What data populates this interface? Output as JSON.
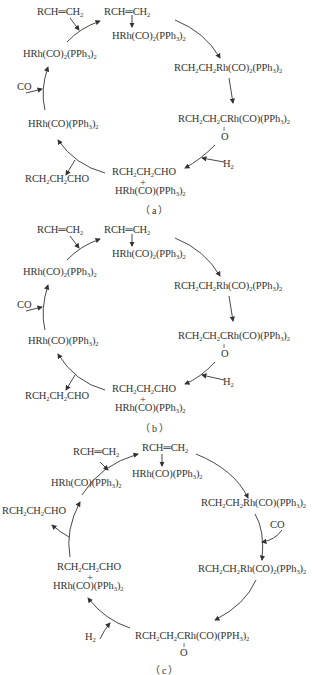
{
  "panels": [
    {
      "caption": "（a）",
      "species": {
        "alkene_in": "RCH=CH2",
        "alkene_complex_top": "RCH=CH2",
        "complex_top": "HRh(CO)2(PPh3)2",
        "alkyl_complex": "RCH2CH2Rh(CO)2(PPh3)2",
        "acyl_complex": "RCH2CH2CRh(CO)(PPh3)2",
        "acyl_oxygen": "O",
        "h2_in": "H2",
        "aldehyde_plus_complex_line1": "RCH2CH2CHO",
        "plus": "+",
        "aldehyde_plus_complex_line2": "HRh(CO)(PPh3)2",
        "aldehyde_out": "RCH2CH2CHO",
        "unsaturated_complex": "HRh(CO)(PPh3)2",
        "co_in": "CO",
        "catalyst": "HRh(CO)2(PPh3)2"
      }
    },
    {
      "caption": "（b）",
      "species": {
        "alkene_in": "RCH=CH2",
        "alkene_complex_top": "RCH=CH2",
        "complex_top": "HRh(CO)2(PPh3)2",
        "alkyl_complex": "RCH2CH2Rh(CO)2(PPh3)2",
        "acyl_complex": "RCH2CH2CRh(CO)(PPh3)2",
        "acyl_oxygen": "O",
        "h2_in": "H2",
        "aldehyde_plus_complex_line1": "RCH2CH2CHO",
        "plus": "+",
        "aldehyde_plus_complex_line2": "HRh(CO)(PPh3)2",
        "aldehyde_out": "RCH2CH2CHO",
        "unsaturated_complex": "HRh(CO)(PPh3)2",
        "co_in": "CO",
        "catalyst": "HRh(CO)2(PPh3)2"
      }
    },
    {
      "caption": "（c）",
      "species": {
        "alkene_in": "RCH=CH2",
        "alkene_complex_top": "RCH=CH2",
        "complex_top": "HRh(CO)(PPh3)2",
        "alkyl_complex": "RCH2CH2Rh(CO)(PPh3)2",
        "co_in": "CO",
        "alkyl_co_complex": "RCH2CH2Rh(CO)2(PPh3)2",
        "acyl_complex": "RCH2CH2CRh(CO)(PPH3)2",
        "acyl_oxygen": "O",
        "h2_in": "H2",
        "aldehyde_plus_complex_line1": "RCH2CH2CHO",
        "plus": "+",
        "aldehyde_plus_complex_line2": "HRh(CO)(PPh3)2",
        "aldehyde_out": "RCH2CH2CHO",
        "catalyst": "HRh(CO)(PPh3)2"
      }
    }
  ]
}
